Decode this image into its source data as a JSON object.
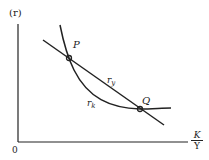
{
  "diagram": {
    "y_axis_label": "(r)",
    "origin_label": "0",
    "x_axis_label": {
      "numerator": "K",
      "denominator": "Y"
    },
    "points": [
      {
        "label": "P",
        "x": 69,
        "y": 58
      },
      {
        "label": "Q",
        "x": 140,
        "y": 109
      }
    ],
    "curves": [
      {
        "name": "r_y",
        "label_main": "r",
        "label_sub": "y",
        "type": "straight-line"
      },
      {
        "name": "r_k",
        "label_main": "r",
        "label_sub": "k",
        "type": "convex-curve"
      }
    ],
    "colors": {
      "ink": "#222222",
      "background": "#ffffff"
    }
  }
}
